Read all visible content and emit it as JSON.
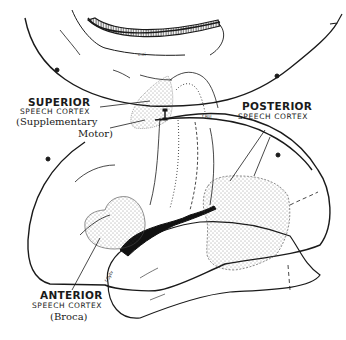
{
  "figure": {
    "type": "anatomical-diagram",
    "colors": {
      "ink": "#1a1a1a",
      "background": "#ffffff",
      "stipple": "#333333"
    }
  },
  "labels": {
    "superior": {
      "title": "SUPERIOR",
      "subtitle": "SPEECH CORTEX",
      "note_line1": "(Supplementary",
      "note_line2": "Motor)"
    },
    "posterior": {
      "title": "POSTERIOR",
      "subtitle": "SPEECH CORTEX"
    },
    "anterior": {
      "title": "ANTERIOR",
      "subtitle": "SPEECH CORTEX",
      "note": "(Broca)"
    }
  },
  "tiny_labels": {
    "medial_sulcus": "c.ci",
    "rolandic": "f.Rol",
    "sylvian": "f.Sylv"
  },
  "regions": [
    {
      "name": "superior-speech-cortex",
      "fill": "stipple"
    },
    {
      "name": "posterior-speech-cortex",
      "fill": "stipple"
    },
    {
      "name": "anterior-speech-cortex",
      "fill": "stipple"
    }
  ]
}
